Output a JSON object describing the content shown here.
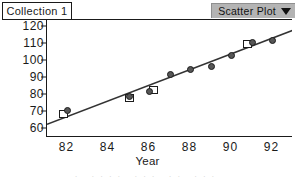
{
  "collection": {
    "title": "Collection 1"
  },
  "toolbar": {
    "plot_type_label": "Scatter Plot",
    "caret_icon": "chevron-down-icon",
    "background_color": "#b4b4b4"
  },
  "artifact_text": "· ···· ··· ·· ···",
  "chart_data": {
    "type": "scatter",
    "title": "",
    "xlabel": "Year",
    "ylabel": "Income",
    "xlim": [
      81,
      93
    ],
    "ylim": [
      55,
      124
    ],
    "xticks": [
      82,
      84,
      86,
      88,
      90,
      92
    ],
    "yticks": [
      60,
      70,
      80,
      90,
      100,
      110,
      120
    ],
    "grid": false,
    "legend": "none",
    "marker_colors": {
      "circle_fill": "#565656",
      "circle_edge": "#1c1c1c",
      "square_fill": "#ffffff",
      "square_edge": "#1c1c1c",
      "line": "#333333"
    },
    "series": [
      {
        "name": "Income (circles)",
        "marker": "circle",
        "x": [
          82,
          85,
          86,
          87,
          88,
          89,
          90,
          91,
          92
        ],
        "y": [
          71,
          79,
          82,
          92,
          95,
          97,
          103,
          111,
          112
        ]
      },
      {
        "name": "Predicted (squares)",
        "marker": "square",
        "x": [
          81.8,
          85,
          86.2,
          90.8
        ],
        "y": [
          69,
          78.5,
          83,
          110
        ]
      }
    ],
    "fit_line": {
      "type": "line",
      "x": [
        81,
        93
      ],
      "y": [
        63,
        118
      ]
    }
  }
}
